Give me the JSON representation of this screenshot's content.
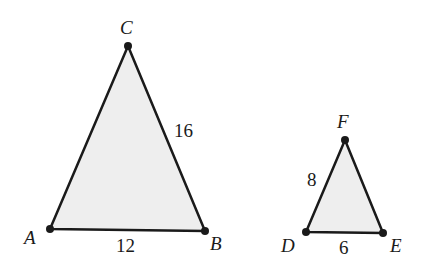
{
  "triangles": [
    {
      "name": "ABC",
      "vertices": {
        "A": {
          "label": "A",
          "x": 50,
          "y": 229
        },
        "B": {
          "label": "B",
          "x": 205,
          "y": 231
        },
        "C": {
          "label": "C",
          "x": 128,
          "y": 46
        }
      },
      "sides": {
        "AB": "12",
        "BC": "16"
      }
    },
    {
      "name": "DEF",
      "vertices": {
        "D": {
          "label": "D",
          "x": 306,
          "y": 232
        },
        "E": {
          "label": "E",
          "x": 383,
          "y": 233
        },
        "F": {
          "label": "F",
          "x": 345,
          "y": 140
        }
      },
      "sides": {
        "DE": "6",
        "DF": "8"
      }
    }
  ],
  "colors": {
    "fill": "#eeeeee",
    "stroke": "#1a1a1a"
  }
}
